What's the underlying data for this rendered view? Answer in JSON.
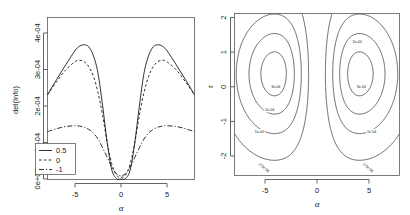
{
  "figure": {
    "panels": [
      "left",
      "right"
    ]
  },
  "chart_data": [
    {
      "type": "line",
      "panel": "left",
      "title": "",
      "xlabel": "α",
      "ylabel": "det(Info)",
      "xlim": [
        -8,
        8
      ],
      "ylim": [
        0,
        0.00044
      ],
      "xticks": [
        -5,
        0,
        5
      ],
      "xticklabels": [
        "-5",
        "0",
        "5"
      ],
      "yticks": [
        0,
        0.0001,
        0.0002,
        0.0003,
        0.0004
      ],
      "yticklabels": [
        "0e+00",
        "1e-04",
        "2e-04",
        "3e-04",
        "4e-04"
      ],
      "grid": false,
      "legend_position": "bottom-left",
      "legend_title": "",
      "series": [
        {
          "name": "0.5",
          "style": "solid",
          "x": [
            -8.0,
            -7.0,
            -6.0,
            -5.0,
            -4.5,
            -4.0,
            -3.5,
            -3.0,
            -2.5,
            -2.0,
            -1.5,
            -1.0,
            -0.5,
            0.0,
            0.5,
            1.0,
            1.5,
            2.0,
            2.5,
            3.0,
            3.5,
            4.0,
            4.5,
            5.0,
            6.0,
            7.0,
            8.0
          ],
          "y": [
            0.00023,
            0.000272,
            0.000312,
            0.00035,
            0.000362,
            0.000366,
            0.00036,
            0.000336,
            0.000288,
            0.0002,
            0.0001,
            2.6e-05,
            3e-06,
            1e-06,
            3e-06,
            2.6e-05,
            0.0001,
            0.0002,
            0.000288,
            0.000336,
            0.00036,
            0.000366,
            0.000362,
            0.00035,
            0.000312,
            0.000272,
            0.00023
          ]
        },
        {
          "name": "0",
          "style": "dashed",
          "x": [
            -8.0,
            -7.0,
            -6.0,
            -5.0,
            -4.5,
            -4.0,
            -3.5,
            -3.0,
            -2.5,
            -2.0,
            -1.5,
            -1.0,
            -0.5,
            0.0,
            0.5,
            1.0,
            1.5,
            2.0,
            2.5,
            3.0,
            3.5,
            4.0,
            4.5,
            5.0,
            6.0,
            7.0,
            8.0
          ],
          "y": [
            0.00023,
            0.000266,
            0.000298,
            0.00032,
            0.000324,
            0.00032,
            0.000306,
            0.00028,
            0.000236,
            0.000174,
            0.0001,
            4.2e-05,
            1.2e-05,
            6e-06,
            1.2e-05,
            4.2e-05,
            0.0001,
            0.000174,
            0.000236,
            0.00028,
            0.000306,
            0.00032,
            0.000324,
            0.00032,
            0.000298,
            0.000266,
            0.00023
          ]
        },
        {
          "name": "-1",
          "style": "dashdot",
          "x": [
            -8.0,
            -7.0,
            -6.0,
            -5.0,
            -4.5,
            -4.0,
            -3.5,
            -3.0,
            -2.5,
            -2.0,
            -1.5,
            -1.0,
            -0.5,
            0.0,
            0.5,
            1.0,
            1.5,
            2.0,
            2.5,
            3.0,
            3.5,
            4.0,
            4.5,
            5.0,
            6.0,
            7.0,
            8.0
          ],
          "y": [
            0.00013,
            0.000138,
            0.000144,
            0.000146,
            0.000145,
            0.000142,
            0.000136,
            0.000126,
            0.00011,
            8.6e-05,
            6e-05,
            3.4e-05,
            1.6e-05,
            1e-05,
            1.6e-05,
            3.4e-05,
            6e-05,
            8.6e-05,
            0.00011,
            0.000126,
            0.000136,
            0.000142,
            0.000145,
            0.000146,
            0.000144,
            0.000138,
            0.00013
          ]
        }
      ]
    },
    {
      "type": "contour",
      "panel": "right",
      "title": "",
      "xlabel": "α",
      "ylabel": "τ",
      "xlim": [
        -8,
        8
      ],
      "ylim": [
        -2.5,
        2.2
      ],
      "xticks": [
        -5,
        0,
        5
      ],
      "xticklabels": [
        "-5",
        "0",
        "5"
      ],
      "yticks": [
        -2,
        -1,
        0,
        1,
        2
      ],
      "yticklabels": [
        "-2",
        "-1",
        "0",
        "1",
        "2"
      ],
      "grid": false,
      "levels": [
        2.5e-05,
        0.0001,
        0.0002,
        0.0003
      ],
      "level_labels": [
        "2.5e-05",
        "1e-04",
        "2e-04",
        "3e-04"
      ],
      "contour_labels": [
        {
          "text": "3e-04",
          "x": -4.0,
          "y": 0.05
        },
        {
          "text": "3e-04",
          "x": 4.3,
          "y": 0.05
        },
        {
          "text": "2e-04",
          "x": -4.6,
          "y": -0.62
        },
        {
          "text": "2e-04",
          "x": 3.9,
          "y": 1.33
        },
        {
          "text": "1e-04",
          "x": -5.6,
          "y": -1.28
        },
        {
          "text": "1e-04",
          "x": 5.3,
          "y": -1.28
        },
        {
          "text": "2.5e-05",
          "x": -5.2,
          "y": -2.3
        },
        {
          "text": "2.5e-05",
          "x": 4.9,
          "y": -2.3
        }
      ]
    }
  ]
}
